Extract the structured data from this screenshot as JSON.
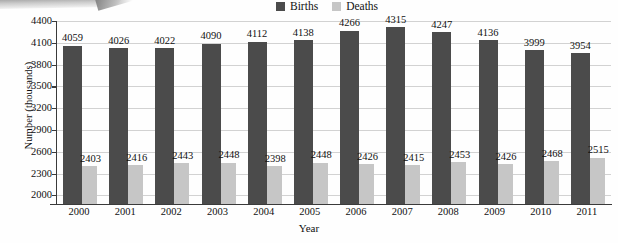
{
  "chart_data": {
    "type": "bar",
    "title": "",
    "xlabel": "Year",
    "ylabel": "Number (thousands)",
    "categories": [
      "2000",
      "2001",
      "2002",
      "2003",
      "2004",
      "2005",
      "2006",
      "2007",
      "2008",
      "2009",
      "2010",
      "2011"
    ],
    "series": [
      {
        "name": "Births",
        "color": "#4b4b4b",
        "values": [
          4059,
          4026,
          4022,
          4090,
          4112,
          4138,
          4266,
          4315,
          4247,
          4136,
          3999,
          3954
        ]
      },
      {
        "name": "Deaths",
        "color": "#c6c6c6",
        "values": [
          2403,
          2416,
          2443,
          2448,
          2398,
          2448,
          2426,
          2415,
          2453,
          2426,
          2468,
          2515
        ]
      }
    ],
    "ylim": [
      1880,
      4400
    ],
    "yticks": [
      2000,
      2300,
      2600,
      2900,
      3200,
      3500,
      3800,
      4100,
      4400
    ],
    "ytick_labels": [
      "2000",
      "2300",
      "2600",
      "2900",
      "3200",
      "3500",
      "3800",
      "4100",
      "4400"
    ],
    "grid": true,
    "legend_position": "top-center",
    "legend": [
      "Births",
      "Deaths"
    ]
  }
}
